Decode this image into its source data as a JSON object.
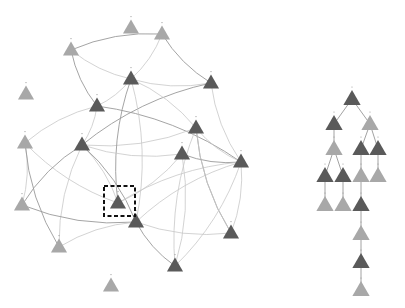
{
  "figure": {
    "left_panel": "graph",
    "right_panel": "tree",
    "selection_box": {
      "x": 104,
      "y": 186,
      "w": 31,
      "h": 30
    }
  },
  "graph": {
    "nodes": [
      {
        "id": "g1",
        "x": 131,
        "y": 28,
        "tone": "light"
      },
      {
        "id": "g2",
        "x": 162,
        "y": 34,
        "tone": "light"
      },
      {
        "id": "g3",
        "x": 71,
        "y": 50,
        "tone": "light"
      },
      {
        "id": "g4",
        "x": 26,
        "y": 94,
        "tone": "light"
      },
      {
        "id": "g5",
        "x": 131,
        "y": 79,
        "tone": "dark"
      },
      {
        "id": "g6",
        "x": 211,
        "y": 83,
        "tone": "dark"
      },
      {
        "id": "g7",
        "x": 97,
        "y": 106,
        "tone": "dark"
      },
      {
        "id": "g8",
        "x": 196,
        "y": 128,
        "tone": "dark"
      },
      {
        "id": "g9",
        "x": 25,
        "y": 143,
        "tone": "light"
      },
      {
        "id": "g10",
        "x": 82,
        "y": 145,
        "tone": "dark"
      },
      {
        "id": "g11",
        "x": 182,
        "y": 154,
        "tone": "dark"
      },
      {
        "id": "g12",
        "x": 241,
        "y": 162,
        "tone": "dark"
      },
      {
        "id": "g13",
        "x": 22,
        "y": 205,
        "tone": "light"
      },
      {
        "id": "g14",
        "x": 118,
        "y": 203,
        "tone": "dark"
      },
      {
        "id": "g15",
        "x": 136,
        "y": 222,
        "tone": "dark"
      },
      {
        "id": "g16",
        "x": 231,
        "y": 233,
        "tone": "dark"
      },
      {
        "id": "g17",
        "x": 59,
        "y": 247,
        "tone": "light"
      },
      {
        "id": "g18",
        "x": 175,
        "y": 266,
        "tone": "dark"
      },
      {
        "id": "g19",
        "x": 111,
        "y": 286,
        "tone": "light"
      }
    ],
    "edges": [
      [
        "g3",
        "g2"
      ],
      [
        "g3",
        "g5"
      ],
      [
        "g2",
        "g5"
      ],
      [
        "g2",
        "g6"
      ],
      [
        "g6",
        "g5"
      ],
      [
        "g7",
        "g5"
      ],
      [
        "g7",
        "g3"
      ],
      [
        "g7",
        "g9"
      ],
      [
        "g7",
        "g10"
      ],
      [
        "g6",
        "g10"
      ],
      [
        "g5",
        "g8"
      ],
      [
        "g6",
        "g12"
      ],
      [
        "g7",
        "g12"
      ],
      [
        "g9",
        "g14"
      ],
      [
        "g9",
        "g13"
      ],
      [
        "g9",
        "g17"
      ],
      [
        "g10",
        "g14"
      ],
      [
        "g10",
        "g17"
      ],
      [
        "g10",
        "g15"
      ],
      [
        "g8",
        "g12"
      ],
      [
        "g8",
        "g10"
      ],
      [
        "g11",
        "g12"
      ],
      [
        "g11",
        "g18"
      ],
      [
        "g8",
        "g18"
      ],
      [
        "g15",
        "g13"
      ],
      [
        "g15",
        "g17"
      ],
      [
        "g15",
        "g12"
      ],
      [
        "g15",
        "g18"
      ],
      [
        "g14",
        "g12"
      ],
      [
        "g16",
        "g12"
      ],
      [
        "g16",
        "g8"
      ],
      [
        "g18",
        "g12"
      ],
      [
        "g5",
        "g15"
      ],
      [
        "g5",
        "g14"
      ],
      [
        "g11",
        "g14"
      ],
      [
        "g8",
        "g16"
      ],
      [
        "g13",
        "g10"
      ],
      [
        "g15",
        "g16"
      ],
      [
        "g11",
        "g10"
      ]
    ]
  },
  "tree": {
    "nodes": [
      {
        "id": "t1",
        "x": 352,
        "y": 99,
        "tone": "dark"
      },
      {
        "id": "t2",
        "x": 334,
        "y": 124,
        "tone": "dark"
      },
      {
        "id": "t3",
        "x": 370,
        "y": 124,
        "tone": "light"
      },
      {
        "id": "t4",
        "x": 334,
        "y": 149,
        "tone": "light"
      },
      {
        "id": "t5",
        "x": 361,
        "y": 149,
        "tone": "dark"
      },
      {
        "id": "t6",
        "x": 378,
        "y": 149,
        "tone": "dark"
      },
      {
        "id": "t7",
        "x": 325,
        "y": 176,
        "tone": "dark"
      },
      {
        "id": "t8",
        "x": 343,
        "y": 176,
        "tone": "dark"
      },
      {
        "id": "t9",
        "x": 361,
        "y": 176,
        "tone": "light"
      },
      {
        "id": "t10",
        "x": 378,
        "y": 176,
        "tone": "light"
      },
      {
        "id": "t11",
        "x": 325,
        "y": 205,
        "tone": "light"
      },
      {
        "id": "t12",
        "x": 343,
        "y": 205,
        "tone": "light"
      },
      {
        "id": "t13",
        "x": 361,
        "y": 205,
        "tone": "dark"
      },
      {
        "id": "t14",
        "x": 361,
        "y": 234,
        "tone": "light"
      },
      {
        "id": "t15",
        "x": 361,
        "y": 262,
        "tone": "dark"
      },
      {
        "id": "t16",
        "x": 361,
        "y": 290,
        "tone": "light"
      }
    ],
    "edges": [
      [
        "t1",
        "t2"
      ],
      [
        "t1",
        "t3"
      ],
      [
        "t2",
        "t4"
      ],
      [
        "t3",
        "t5"
      ],
      [
        "t3",
        "t6"
      ],
      [
        "t4",
        "t7"
      ],
      [
        "t4",
        "t8"
      ],
      [
        "t5",
        "t9"
      ],
      [
        "t6",
        "t10"
      ],
      [
        "t7",
        "t11"
      ],
      [
        "t8",
        "t12"
      ],
      [
        "t9",
        "t13"
      ],
      [
        "t13",
        "t14"
      ],
      [
        "t14",
        "t15"
      ],
      [
        "t15",
        "t16"
      ]
    ]
  },
  "colors": {
    "dark": "#5a5a5a",
    "light": "#a8a8a8",
    "edge": "#c8c8c8",
    "background": "#ffffff"
  }
}
